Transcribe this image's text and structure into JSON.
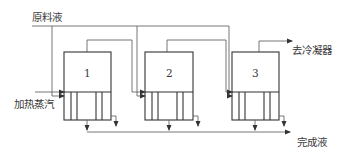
{
  "diagram": {
    "type": "multiple-effect evaporator (parallel feed)",
    "labels": {
      "feed": "原料液",
      "steam": "加热蒸汽",
      "condenser": "去冷凝器",
      "product": "完成液"
    },
    "effects": [
      {
        "id": "1",
        "label": "1"
      },
      {
        "id": "2",
        "label": "2"
      },
      {
        "id": "3",
        "label": "3"
      }
    ],
    "colors": {
      "line": "#555555",
      "box": "#333333",
      "text": "#3a3a3a",
      "background": "#ffffff"
    }
  }
}
